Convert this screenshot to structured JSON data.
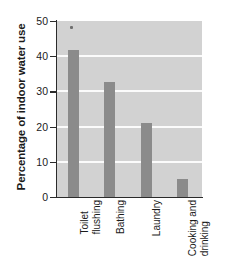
{
  "chart_data": {
    "type": "bar",
    "title": "",
    "subtitle": "",
    "xlabel": "",
    "ylabel": "Percentage of indoor water use",
    "categories": [
      "Toilet flushing",
      "Bathing",
      "Laundry",
      "Cooking and drinking"
    ],
    "category_lines": [
      [
        "Toilet",
        "flushing"
      ],
      [
        "Bathing",
        ""
      ],
      [
        "Laundry",
        ""
      ],
      [
        "Cooking and",
        "drinking"
      ]
    ],
    "values": [
      41.8,
      32.7,
      21.0,
      5.1
    ],
    "ylim": [
      0,
      50
    ],
    "yticks": [
      0,
      10,
      20,
      30,
      40,
      50
    ],
    "ytick_labels": [
      "0",
      "10",
      "20",
      "30",
      "40",
      "50"
    ],
    "gridlines": [
      10,
      20,
      30,
      40
    ],
    "grid": true,
    "legend": "none",
    "colors": {
      "bar": "#8b8b8b",
      "plot_background": "#d2d2d2",
      "gridline": "#fbfbfb",
      "axis": "#2b2b2b",
      "text": "#1b1b1b",
      "figure_background": "#ffffff"
    }
  }
}
